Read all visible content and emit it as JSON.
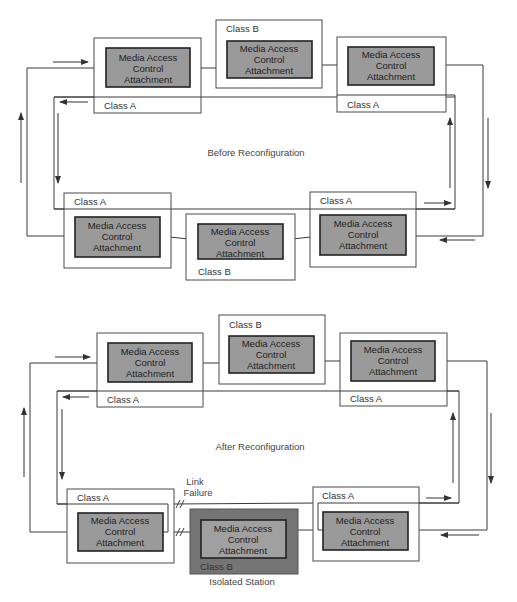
{
  "mac_label": [
    "Media Access",
    "Control",
    "Attachment"
  ],
  "class_a_label": "Class A",
  "class_b_label": "Class B",
  "before": {
    "caption": "Before Reconfiguration"
  },
  "after": {
    "caption": "After Reconfiguration",
    "link_failure_label": [
      "Link",
      "Failure"
    ],
    "isolated_label": "Isolated Station"
  },
  "colors": {
    "mac_fill": "#9a9a9a",
    "isolated_fill": "#747474",
    "line": "#3a3a3a"
  }
}
